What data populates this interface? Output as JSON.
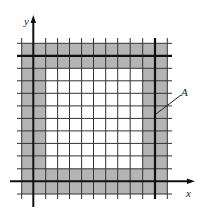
{
  "diagram": {
    "axes": {
      "x_label": "x",
      "y_label": "y"
    },
    "annotation": {
      "label": "A"
    },
    "grid": {
      "columns": 12,
      "rows": 12,
      "shaded_band_width_cells": 2,
      "bold_square_cells": 10
    },
    "colors": {
      "shaded": "#b4b4b4",
      "interior": "#ffffff",
      "grid_line": "#333333",
      "bold_line": "#111111"
    }
  }
}
